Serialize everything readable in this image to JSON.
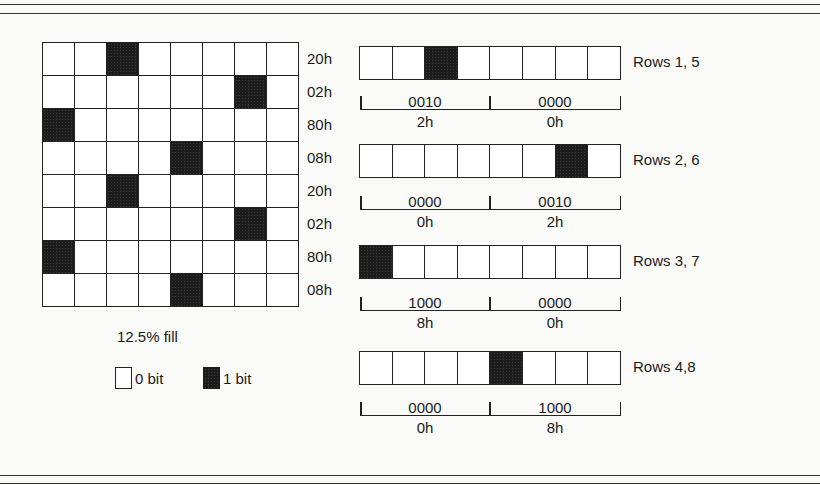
{
  "figure": {
    "fill_label": "12.5% fill",
    "legend": [
      {
        "swatch": "empty",
        "label": "0 bit"
      },
      {
        "swatch": "filled",
        "label": "1 bit"
      }
    ],
    "colors": {
      "bit_on": "#1c1c1c",
      "bit_off": "#ffffff",
      "line": "#222222"
    }
  },
  "grid": {
    "rows": [
      {
        "bits": [
          0,
          0,
          1,
          0,
          0,
          0,
          0,
          0
        ],
        "hex": "20h"
      },
      {
        "bits": [
          0,
          0,
          0,
          0,
          0,
          0,
          1,
          0
        ],
        "hex": "02h"
      },
      {
        "bits": [
          1,
          0,
          0,
          0,
          0,
          0,
          0,
          0
        ],
        "hex": "80h"
      },
      {
        "bits": [
          0,
          0,
          0,
          0,
          1,
          0,
          0,
          0
        ],
        "hex": "08h"
      },
      {
        "bits": [
          0,
          0,
          1,
          0,
          0,
          0,
          0,
          0
        ],
        "hex": "20h"
      },
      {
        "bits": [
          0,
          0,
          0,
          0,
          0,
          0,
          1,
          0
        ],
        "hex": "02h"
      },
      {
        "bits": [
          1,
          0,
          0,
          0,
          0,
          0,
          0,
          0
        ],
        "hex": "80h"
      },
      {
        "bits": [
          0,
          0,
          0,
          0,
          1,
          0,
          0,
          0
        ],
        "hex": "08h"
      }
    ]
  },
  "breakdowns": [
    {
      "label": "Rows 1, 5",
      "bits": [
        0,
        0,
        1,
        0,
        0,
        0,
        0,
        0
      ],
      "high_nibble": "0010",
      "low_nibble": "0000",
      "high_hex": "2h",
      "low_hex": "0h"
    },
    {
      "label": "Rows 2, 6",
      "bits": [
        0,
        0,
        0,
        0,
        0,
        0,
        1,
        0
      ],
      "high_nibble": "0000",
      "low_nibble": "0010",
      "high_hex": "0h",
      "low_hex": "2h"
    },
    {
      "label": "Rows 3, 7",
      "bits": [
        1,
        0,
        0,
        0,
        0,
        0,
        0,
        0
      ],
      "high_nibble": "1000",
      "low_nibble": "0000",
      "high_hex": "8h",
      "low_hex": "0h"
    },
    {
      "label": "Rows 4,8",
      "bits": [
        0,
        0,
        0,
        0,
        1,
        0,
        0,
        0
      ],
      "high_nibble": "0000",
      "low_nibble": "1000",
      "high_hex": "0h",
      "low_hex": "8h"
    }
  ]
}
